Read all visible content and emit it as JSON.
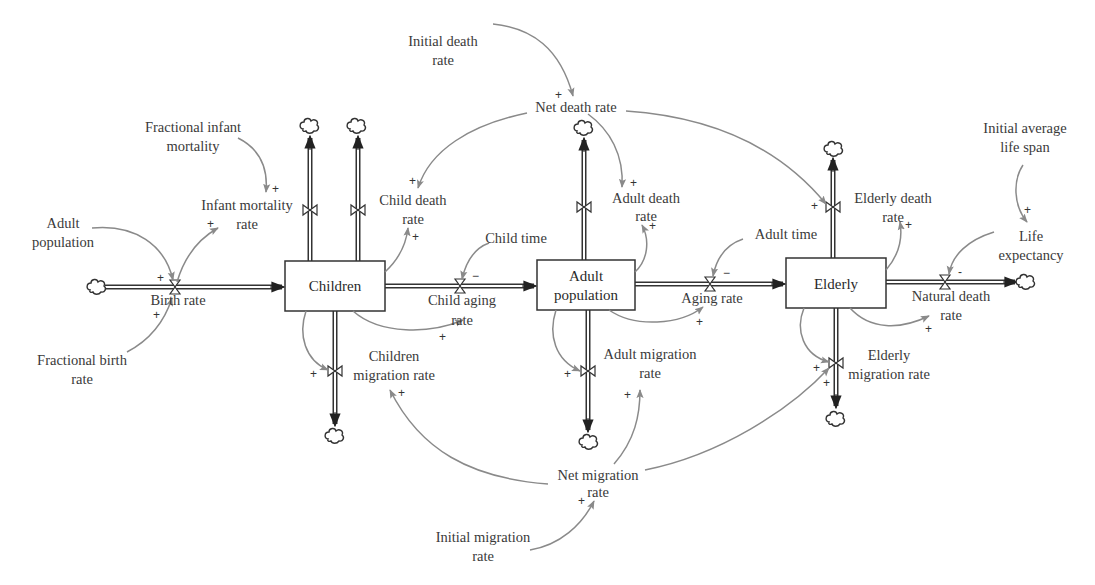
{
  "diagram": {
    "type": "stock-and-flow",
    "colors": {
      "stroke": "#333333",
      "link": "#8a8a8a",
      "text": "#3a3a3a",
      "background": "#ffffff"
    },
    "stocks": [
      {
        "id": "children",
        "label": "Children",
        "x": 285,
        "y": 261,
        "w": 100,
        "h": 50
      },
      {
        "id": "adult",
        "label_lines": [
          "Adult",
          "population"
        ],
        "x": 537,
        "y": 260,
        "w": 98,
        "h": 50
      },
      {
        "id": "elderly",
        "label": "Elderly",
        "x": 786,
        "y": 258,
        "w": 100,
        "h": 50
      }
    ],
    "flows": [
      {
        "id": "birth_rate",
        "label_lines": [
          "Birth rate"
        ]
      },
      {
        "id": "infant_mortality_rate",
        "label_lines": [
          "Infant mortality",
          "rate"
        ]
      },
      {
        "id": "child_death_rate",
        "label_lines": [
          "Child death",
          "rate"
        ]
      },
      {
        "id": "child_aging_rate",
        "label_lines": [
          "Child aging",
          "rate"
        ]
      },
      {
        "id": "children_migration_rate",
        "label_lines": [
          "Children",
          "migration rate"
        ]
      },
      {
        "id": "adult_death_rate",
        "label_lines": [
          "Adult death",
          "rate"
        ]
      },
      {
        "id": "aging_rate",
        "label_lines": [
          "Aging rate"
        ]
      },
      {
        "id": "adult_migration_rate",
        "label_lines": [
          "Adult migration",
          "rate"
        ]
      },
      {
        "id": "elderly_death_rate",
        "label_lines": [
          "Elderly death",
          "rate"
        ]
      },
      {
        "id": "natural_death_rate",
        "label_lines": [
          "Natural death",
          "rate"
        ]
      },
      {
        "id": "elderly_migration_rate",
        "label_lines": [
          "Elderly",
          "migration rate"
        ]
      }
    ],
    "auxiliaries": [
      {
        "id": "adult_population_aux",
        "label_lines": [
          "Adult",
          "population"
        ]
      },
      {
        "id": "fractional_birth_rate",
        "label_lines": [
          "Fractional birth",
          "rate"
        ]
      },
      {
        "id": "fractional_infant_mortality",
        "label_lines": [
          "Fractional infant",
          "mortality"
        ]
      },
      {
        "id": "initial_death_rate",
        "label_lines": [
          "Initial death",
          "rate"
        ]
      },
      {
        "id": "net_death_rate",
        "label_lines": [
          "Net death rate"
        ]
      },
      {
        "id": "child_time",
        "label_lines": [
          "Child time"
        ]
      },
      {
        "id": "adult_time",
        "label_lines": [
          "Adult time"
        ]
      },
      {
        "id": "initial_average_life_span",
        "label_lines": [
          "Initial average",
          "life span"
        ]
      },
      {
        "id": "life_expectancy",
        "label_lines": [
          "Life",
          "expectancy"
        ]
      },
      {
        "id": "net_migration_rate",
        "label_lines": [
          "Net migration",
          "rate"
        ]
      },
      {
        "id": "initial_migration_rate",
        "label_lines": [
          "Initial migration",
          "rate"
        ]
      }
    ],
    "links": [
      {
        "from": "Adult population",
        "to": "Birth rate",
        "polarity": "+"
      },
      {
        "from": "Fractional birth rate",
        "to": "Birth rate",
        "polarity": "+"
      },
      {
        "from": "Birth rate",
        "to": "Infant mortality rate",
        "polarity": "+"
      },
      {
        "from": "Fractional infant mortality",
        "to": "Infant mortality rate",
        "polarity": "+"
      },
      {
        "from": "Initial death rate",
        "to": "Net death rate",
        "polarity": "+"
      },
      {
        "from": "Net death rate",
        "to": "Child death rate",
        "polarity": "+"
      },
      {
        "from": "Net death rate",
        "to": "Adult death rate",
        "polarity": "+"
      },
      {
        "from": "Net death rate",
        "to": "Elderly death rate",
        "polarity": "+"
      },
      {
        "from": "Children",
        "to": "Child death rate",
        "polarity": "+"
      },
      {
        "from": "Children",
        "to": "Child aging rate",
        "polarity": "+"
      },
      {
        "from": "Child time",
        "to": "Child aging rate",
        "polarity": "−"
      },
      {
        "from": "Children",
        "to": "Children migration rate",
        "polarity": "+"
      },
      {
        "from": "Adult population",
        "to": "Adult death rate",
        "polarity": "+"
      },
      {
        "from": "Adult population",
        "to": "Aging rate",
        "polarity": "+"
      },
      {
        "from": "Adult time",
        "to": "Aging rate",
        "polarity": "−"
      },
      {
        "from": "Adult population",
        "to": "Adult migration rate",
        "polarity": "+"
      },
      {
        "from": "Elderly",
        "to": "Elderly death rate",
        "polarity": "+"
      },
      {
        "from": "Elderly",
        "to": "Natural death rate",
        "polarity": "+"
      },
      {
        "from": "Life expectancy",
        "to": "Natural death rate",
        "polarity": "-"
      },
      {
        "from": "Initial average life span",
        "to": "Life expectancy",
        "polarity": "+"
      },
      {
        "from": "Elderly",
        "to": "Elderly migration rate",
        "polarity": "+"
      },
      {
        "from": "Net migration rate",
        "to": "Children migration rate",
        "polarity": "+"
      },
      {
        "from": "Net migration rate",
        "to": "Adult migration rate",
        "polarity": "+"
      },
      {
        "from": "Net migration rate",
        "to": "Elderly migration rate",
        "polarity": "+"
      },
      {
        "from": "Initial migration rate",
        "to": "Net migration rate",
        "polarity": "+"
      }
    ]
  },
  "labels": {
    "children": "Children",
    "adult_l1": "Adult",
    "adult_l2": "population",
    "elderly": "Elderly",
    "birth_rate": "Birth rate",
    "infant_l1": "Infant mortality",
    "infant_l2": "rate",
    "child_death_l1": "Child death",
    "child_death_l2": "rate",
    "child_aging_l1": "Child aging",
    "child_aging_l2": "rate",
    "children_mig_l1": "Children",
    "children_mig_l2": "migration rate",
    "adult_death_l1": "Adult death",
    "adult_death_l2": "rate",
    "aging_rate": "Aging rate",
    "adult_mig_l1": "Adult migration",
    "adult_mig_l2": "rate",
    "elderly_death_l1": "Elderly death",
    "elderly_death_l2": "rate",
    "natural_death_l1": "Natural death",
    "natural_death_l2": "rate",
    "elderly_mig_l1": "Elderly",
    "elderly_mig_l2": "migration rate",
    "adult_pop_aux_l1": "Adult",
    "adult_pop_aux_l2": "population",
    "frac_birth_l1": "Fractional birth",
    "frac_birth_l2": "rate",
    "frac_infant_l1": "Fractional infant",
    "frac_infant_l2": "mortality",
    "init_death_l1": "Initial death",
    "init_death_l2": "rate",
    "net_death": "Net death rate",
    "child_time": "Child time",
    "adult_time": "Adult time",
    "init_life_l1": "Initial average",
    "init_life_l2": "life span",
    "life_exp_l1": "Life",
    "life_exp_l2": "expectancy",
    "net_mig_l1": "Net migration",
    "net_mig_l2": "rate",
    "init_mig_l1": "Initial migration",
    "init_mig_l2": "rate"
  },
  "polarity": {
    "plus": "+",
    "minus": "−",
    "dash": "-"
  }
}
